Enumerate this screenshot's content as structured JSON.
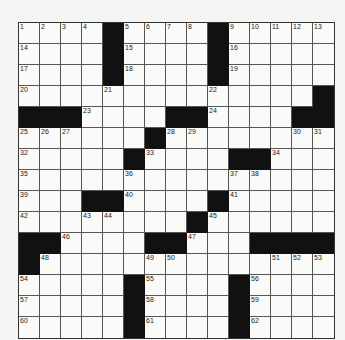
{
  "puzzle": {
    "size": 15,
    "rows": [
      "....#....#.....",
      "....#....#.....",
      "....#....#.....",
      "..............#",
      "###....##....##",
      "......#........",
      ".....#....##...",
      "...............",
      "...##....#.....",
      "........#......",
      "##....##...####",
      "#..............",
      ".....#....#....",
      ".....#....#....",
      ".....#....#...."
    ],
    "numbers": [
      [
        0,
        0,
        1
      ],
      [
        0,
        1,
        2
      ],
      [
        0,
        2,
        3
      ],
      [
        0,
        3,
        4
      ],
      [
        0,
        5,
        5
      ],
      [
        0,
        6,
        6
      ],
      [
        0,
        7,
        7
      ],
      [
        0,
        8,
        8
      ],
      [
        0,
        10,
        9
      ],
      [
        0,
        11,
        10
      ],
      [
        0,
        12,
        11
      ],
      [
        0,
        13,
        12
      ],
      [
        0,
        14,
        13
      ],
      [
        1,
        0,
        14
      ],
      [
        1,
        5,
        15
      ],
      [
        1,
        10,
        16
      ],
      [
        2,
        0,
        17
      ],
      [
        2,
        5,
        18
      ],
      [
        2,
        10,
        19
      ],
      [
        3,
        0,
        20
      ],
      [
        3,
        4,
        21
      ],
      [
        3,
        9,
        22
      ],
      [
        4,
        3,
        23
      ],
      [
        4,
        9,
        24
      ],
      [
        5,
        0,
        25
      ],
      [
        5,
        1,
        26
      ],
      [
        5,
        2,
        27
      ],
      [
        5,
        7,
        28
      ],
      [
        5,
        8,
        29
      ],
      [
        5,
        13,
        30
      ],
      [
        5,
        14,
        31
      ],
      [
        6,
        0,
        32
      ],
      [
        6,
        6,
        33
      ],
      [
        6,
        12,
        34
      ],
      [
        7,
        0,
        35
      ],
      [
        7,
        5,
        36
      ],
      [
        7,
        10,
        37
      ],
      [
        7,
        11,
        38
      ],
      [
        8,
        0,
        39
      ],
      [
        8,
        5,
        40
      ],
      [
        8,
        10,
        41
      ],
      [
        9,
        0,
        42
      ],
      [
        9,
        3,
        43
      ],
      [
        9,
        4,
        44
      ],
      [
        9,
        9,
        45
      ],
      [
        10,
        2,
        46
      ],
      [
        10,
        8,
        47
      ],
      [
        11,
        1,
        48
      ],
      [
        11,
        6,
        49
      ],
      [
        11,
        7,
        50
      ],
      [
        11,
        12,
        51
      ],
      [
        11,
        13,
        52
      ],
      [
        11,
        14,
        53
      ],
      [
        12,
        0,
        54
      ],
      [
        12,
        6,
        55
      ],
      [
        12,
        11,
        56
      ],
      [
        13,
        0,
        57
      ],
      [
        13,
        6,
        58
      ],
      [
        13,
        11,
        59
      ],
      [
        14,
        0,
        60
      ],
      [
        14,
        6,
        61
      ],
      [
        14,
        11,
        62
      ]
    ]
  }
}
